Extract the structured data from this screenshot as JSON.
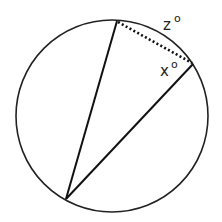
{
  "diagram": {
    "type": "circle-inscribed-angle",
    "circle": {
      "cx": 112,
      "cy": 116,
      "r": 96,
      "stroke": "#222222"
    },
    "points": {
      "top": {
        "x": 117,
        "y": 21
      },
      "right": {
        "x": 193,
        "y": 64
      },
      "bottom_left": {
        "x": 66,
        "y": 199
      }
    },
    "labels": {
      "arc": {
        "var": "z",
        "unit": "o"
      },
      "angle": {
        "var": "x",
        "unit": "o"
      }
    },
    "dotted_chord": "top-to-right"
  }
}
